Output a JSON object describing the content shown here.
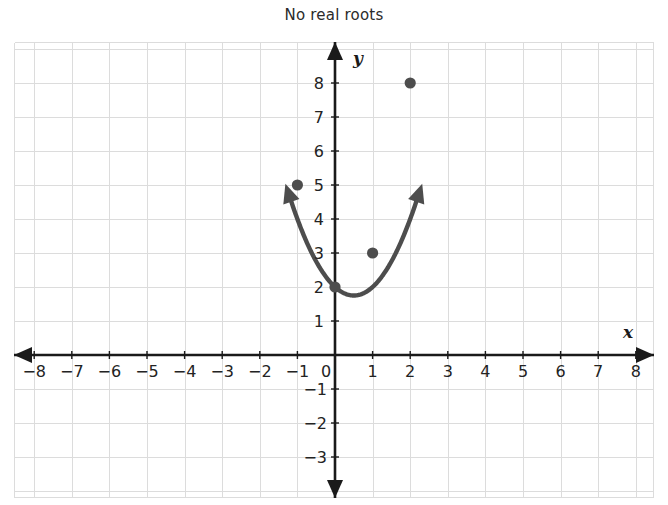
{
  "chart_title": "No real roots",
  "axis_labels": {
    "x_name": "x",
    "y_name": "y"
  },
  "x_ticks": [
    "−8",
    "−7",
    "−6",
    "−5",
    "−4",
    "−3",
    "−2",
    "−1",
    "0",
    "1",
    "2",
    "3",
    "4",
    "5",
    "6",
    "7",
    "8"
  ],
  "y_ticks_positive": [
    "1",
    "2",
    "3",
    "4",
    "5",
    "6",
    "7",
    "8"
  ],
  "y_ticks_negative": [
    "−1",
    "−2",
    "−3"
  ],
  "colors": {
    "curve": "#4d4d4d",
    "axis": "#1a1a1a",
    "grid": "#dcdcdc",
    "point": "#4d4d4d",
    "text": "#232323",
    "background": "#ffffff"
  },
  "chart_data": {
    "type": "line",
    "title": "No real roots",
    "subtitle": "",
    "xlabel": "x",
    "ylabel": "y",
    "xlim": [
      -8.6,
      8.6
    ],
    "ylim": [
      -3.7,
      8.9
    ],
    "grid": true,
    "legend": "none",
    "equation": "y = x^2 - x + 2",
    "vertex": [
      0.5,
      1.75
    ],
    "series": [
      {
        "name": "y = x^2 - x + 2",
        "x": [
          -1.1,
          -1.0,
          -0.8,
          -0.6,
          -0.4,
          -0.2,
          0.0,
          0.2,
          0.4,
          0.5,
          0.6,
          0.8,
          1.0,
          1.2,
          1.4,
          1.6,
          1.8,
          2.0,
          2.1
        ],
        "y": [
          5.31,
          5.0,
          4.44,
          3.96,
          3.56,
          3.24,
          2.0,
          1.8,
          1.76,
          1.75,
          1.76,
          2.04,
          3.0,
          2.24,
          2.56,
          2.96,
          3.44,
          8.0,
          8.51
        ]
      }
    ],
    "marked_points": [
      {
        "x": -1,
        "y": 5,
        "label": "(-1, 5)"
      },
      {
        "x": 0,
        "y": 2,
        "label": "(0, 2)"
      },
      {
        "x": 1,
        "y": 3,
        "label": "(1, 3)"
      },
      {
        "x": 2,
        "y": 8,
        "label": "(2, 8)"
      }
    ],
    "annotations": [
      {
        "type": "arrow",
        "at": [
          -1.15,
          8.6
        ],
        "direction": "up-left-branch"
      },
      {
        "type": "arrow",
        "at": [
          2.15,
          8.6
        ],
        "direction": "up-right-branch"
      }
    ],
    "x_tick_values": [
      -8,
      -7,
      -6,
      -5,
      -4,
      -3,
      -2,
      -1,
      0,
      1,
      2,
      3,
      4,
      5,
      6,
      7,
      8
    ],
    "y_tick_values": [
      -3,
      -2,
      -1,
      1,
      2,
      3,
      4,
      5,
      6,
      7,
      8
    ]
  }
}
